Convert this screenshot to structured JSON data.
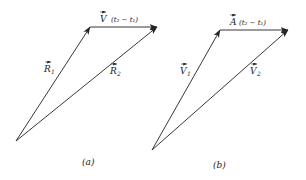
{
  "figure": {
    "panel_a": {
      "caption": "(a)",
      "vectors": [
        {
          "name": "R1",
          "symbol": "R",
          "subscript": "1",
          "from": [
            16,
            141
          ],
          "to": [
            90,
            27
          ]
        },
        {
          "name": "R2",
          "symbol": "R",
          "subscript": "2",
          "from": [
            16,
            141
          ],
          "to": [
            157,
            27
          ]
        },
        {
          "name": "V(t2 - t1)",
          "symbol": "V",
          "from": [
            90,
            27
          ],
          "to": [
            157,
            27
          ]
        }
      ],
      "labels": {
        "top_symbol": "V",
        "top_expr": "(t₂ − t₁)",
        "left_symbol": "R",
        "left_sub": "1",
        "right_symbol": "R",
        "right_sub": "2"
      }
    },
    "panel_b": {
      "caption": "(b)",
      "vectors": [
        {
          "name": "V1",
          "symbol": "V",
          "subscript": "1",
          "from": [
            152,
            150
          ],
          "to": [
            220,
            30
          ]
        },
        {
          "name": "V2",
          "symbol": "V",
          "subscript": "2",
          "from": [
            152,
            150
          ],
          "to": [
            288,
            30
          ]
        },
        {
          "name": "A(t2 - t1)",
          "symbol": "A",
          "from": [
            220,
            30
          ],
          "to": [
            288,
            30
          ]
        }
      ],
      "labels": {
        "top_symbol": "A",
        "top_expr": "(t₂ − t₁)",
        "left_symbol": "V",
        "left_sub": "1",
        "right_symbol": "V",
        "right_sub": "2"
      }
    },
    "colors": {
      "ink": "#222222",
      "background": "#ffffff"
    }
  }
}
